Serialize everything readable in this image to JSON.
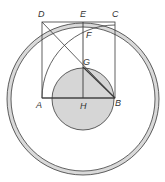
{
  "diagram": {
    "colors": {
      "stroke": "#3a3a3a",
      "ring_fill": "#d9d9d9",
      "inner_circle_fill": "#d6d6d6",
      "background": "#ffffff"
    },
    "labels": {
      "A": "A",
      "B": "B",
      "C": "C",
      "D": "D",
      "E": "E",
      "F": "F",
      "G": "G",
      "H": "H"
    }
  }
}
